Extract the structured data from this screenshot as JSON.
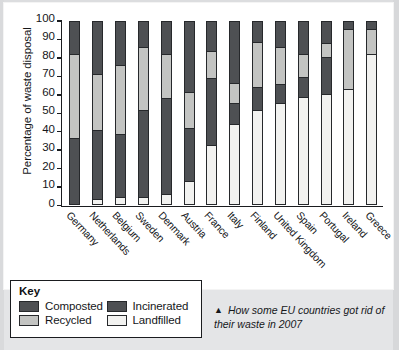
{
  "chart_data": {
    "type": "bar",
    "subtype": "stacked-bar-100",
    "title": "",
    "xlabel": "",
    "ylabel": "Percentage of waste disposal",
    "ylim": [
      0,
      100
    ],
    "ytick_labels": [
      "100",
      "90",
      "80",
      "70",
      "60",
      "50",
      "40",
      "30",
      "20",
      "10",
      "0"
    ],
    "yticks": [
      100,
      90,
      80,
      70,
      60,
      50,
      40,
      30,
      20,
      10,
      0
    ],
    "grid": false,
    "legend_position": "below-left",
    "categories": [
      "Germany",
      "Netherlands",
      "Belgium",
      "Sweden",
      "Denmark",
      "Austria",
      "France",
      "Italy",
      "Finland",
      "United Kingdom",
      "Spain",
      "Portugal",
      "Ireland",
      "Greece"
    ],
    "series": [
      {
        "name": "Landfilled",
        "color": "#f2f2f0",
        "values": [
          0,
          2,
          3,
          3,
          4.5,
          12,
          32,
          44,
          52,
          56,
          59,
          61,
          63,
          83
        ]
      },
      {
        "name": "Composted",
        "color": "#4e5053",
        "values": [
          36,
          38,
          35,
          48,
          53.5,
          29,
          37,
          11,
          12,
          10,
          11,
          20,
          0,
          0
        ]
      },
      {
        "name": "Recycled",
        "color": "#c3c4c2",
        "values": [
          46,
          31,
          38,
          35,
          24,
          20,
          15,
          11,
          25,
          20,
          12,
          7,
          33,
          13
        ]
      },
      {
        "name": "Incinerated",
        "color": "#4e5053",
        "values": [
          18,
          29,
          24,
          14,
          18,
          39,
          16,
          34,
          11,
          14,
          18,
          12,
          4,
          4
        ]
      }
    ],
    "cumulative_tops": {
      "Germany": {
        "landfilled": 0,
        "composted": 36,
        "recycled": 82,
        "incinerated": 100
      },
      "Netherlands": {
        "landfilled": 2,
        "composted": 40,
        "recycled": 71,
        "incinerated": 100
      },
      "Belgium": {
        "landfilled": 3,
        "composted": 38,
        "recycled": 76,
        "incinerated": 100
      },
      "Sweden": {
        "landfilled": 3,
        "composted": 51,
        "recycled": 86,
        "incinerated": 100
      },
      "Denmark": {
        "landfilled": 4.5,
        "composted": 58,
        "recycled": 82,
        "incinerated": 100
      },
      "Austria": {
        "landfilled": 12,
        "composted": 41,
        "recycled": 61,
        "incinerated": 100
      },
      "France": {
        "landfilled": 32,
        "composted": 69,
        "recycled": 84,
        "incinerated": 100
      },
      "Italy": {
        "landfilled": 44,
        "composted": 55,
        "recycled": 66,
        "incinerated": 100
      },
      "Finland": {
        "landfilled": 52,
        "composted": 64,
        "recycled": 89,
        "incinerated": 100
      },
      "United Kingdom": {
        "landfilled": 56,
        "composted": 66,
        "recycled": 86,
        "incinerated": 100
      },
      "Spain": {
        "landfilled": 59,
        "composted": 70,
        "recycled": 82,
        "incinerated": 100
      },
      "Portugal": {
        "landfilled": 61,
        "composted": 81,
        "recycled": 88,
        "incinerated": 100
      },
      "Ireland": {
        "landfilled": 63,
        "composted": 63,
        "recycled": 96,
        "incinerated": 100
      },
      "Greece": {
        "landfilled": 83,
        "composted": 83,
        "recycled": 96,
        "incinerated": 100
      }
    }
  },
  "key": {
    "title": "Key",
    "entries": [
      {
        "label": "Composted",
        "swatch": "composted"
      },
      {
        "label": "Incinerated",
        "swatch": "incinerated"
      },
      {
        "label": "Recycled",
        "swatch": "recycled"
      },
      {
        "label": "Landfilled",
        "swatch": "landfilled"
      }
    ]
  },
  "caption": {
    "marker": "▲",
    "text": "How some EU countries got rid of their waste in 2007"
  }
}
